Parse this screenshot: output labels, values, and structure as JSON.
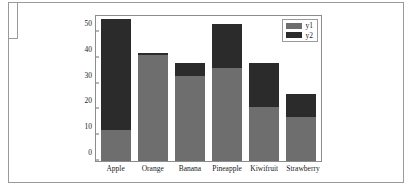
{
  "chart_data": {
    "type": "bar",
    "subtype": "stacked",
    "title": "",
    "xlabel": "",
    "ylabel": "",
    "categories": [
      "Apple",
      "Orange",
      "Banana",
      "Pineapple",
      "Kiwifruit",
      "Strawberry"
    ],
    "series": [
      {
        "name": "y1",
        "color": "#6e6e6e",
        "values": [
          12,
          41,
          33,
          36,
          21,
          17
        ]
      },
      {
        "name": "y2",
        "color": "#2b2b2b",
        "values": [
          43,
          1,
          5,
          17,
          17,
          9
        ]
      }
    ],
    "totals": [
      55,
      42,
      38,
      53,
      38,
      26
    ],
    "ylim": [
      0,
      57
    ],
    "yticks": [
      0,
      10,
      20,
      30,
      40,
      50
    ],
    "ytick_labels": [
      "0",
      "10",
      "20",
      "30",
      "40",
      "50"
    ],
    "grid": false,
    "legend": {
      "position": "top-right",
      "entries": [
        {
          "label": "y1",
          "color": "#6e6e6e"
        },
        {
          "label": "y2",
          "color": "#2b2b2b"
        }
      ]
    }
  },
  "colors": {
    "series_y1": "#6e6e6e",
    "series_y2": "#2b2b2b",
    "axis": "#8c8c8c",
    "text": "#1a1a1a",
    "page_border": "#9a9a9a",
    "background": "#ffffff"
  }
}
